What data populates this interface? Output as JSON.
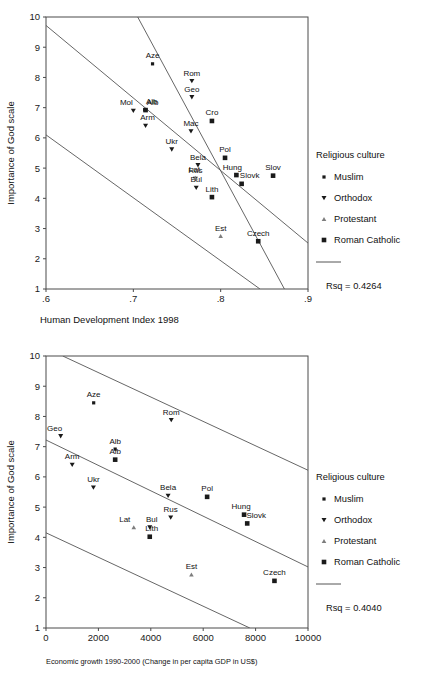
{
  "figure_top": {
    "y_axis_title": "Importance of God scale",
    "x_axis_title": "Human Development Index 1998",
    "x_ticks": [
      ".6",
      ".7",
      ".8",
      ".9"
    ],
    "y_ticks": [
      "1",
      "2",
      "3",
      "4",
      "5",
      "6",
      "7",
      "8",
      "9",
      "10"
    ],
    "rsq": "Rsq = 0.4264",
    "legend_title": "Religious culture",
    "legend": [
      {
        "label": "Muslim",
        "marker": "small-square"
      },
      {
        "label": "Orthodox",
        "marker": "down-triangle"
      },
      {
        "label": "Protestant",
        "marker": "up-triangle"
      },
      {
        "label": "Roman Catholic",
        "marker": "large-square"
      }
    ],
    "chart_data": {
      "type": "scatter",
      "title": "",
      "xlabel": "Human Development Index 1998",
      "ylabel": "Importance of God scale",
      "xlim": [
        0.6,
        0.9
      ],
      "ylim": [
        1,
        10
      ],
      "grid": false,
      "legend_position": "right",
      "annotations": [
        "Rsq = 0.4264"
      ],
      "series": [
        {
          "name": "Muslim",
          "marker": "small-square",
          "points": [
            {
              "label": "Aze",
              "x": 0.722,
              "y": 8.45
            },
            {
              "label": "Alb",
              "x": 0.713,
              "y": 6.93
            }
          ]
        },
        {
          "name": "Orthodox",
          "marker": "down-triangle",
          "points": [
            {
              "label": "Rom",
              "x": 0.767,
              "y": 7.88
            },
            {
              "label": "Geo",
              "x": 0.767,
              "y": 7.35
            },
            {
              "label": "Mol",
              "x": 0.7,
              "y": 6.9
            },
            {
              "label": "Arm",
              "x": 0.714,
              "y": 6.4
            },
            {
              "label": "Mac",
              "x": 0.766,
              "y": 6.22
            },
            {
              "label": "Ukr",
              "x": 0.744,
              "y": 5.62
            },
            {
              "label": "Bela",
              "x": 0.774,
              "y": 5.1
            },
            {
              "label": "Rus",
              "x": 0.771,
              "y": 4.65
            },
            {
              "label": "Bul",
              "x": 0.772,
              "y": 4.35
            }
          ]
        },
        {
          "name": "Protestant",
          "marker": "up-triangle",
          "points": [
            {
              "label": "Lat",
              "x": 0.771,
              "y": 4.68
            },
            {
              "label": "Est",
              "x": 0.8,
              "y": 2.75
            }
          ]
        },
        {
          "name": "Roman Catholic",
          "marker": "large-square",
          "points": [
            {
              "label": "Alb",
              "x": 0.714,
              "y": 6.92
            },
            {
              "label": "Cro",
              "x": 0.79,
              "y": 6.56
            },
            {
              "label": "Pol",
              "x": 0.805,
              "y": 5.34
            },
            {
              "label": "Hung",
              "x": 0.818,
              "y": 4.77
            },
            {
              "label": "Slov",
              "x": 0.86,
              "y": 4.75
            },
            {
              "label": "Slovk",
              "x": 0.824,
              "y": 4.48
            },
            {
              "label": "Lith",
              "x": 0.79,
              "y": 4.04
            },
            {
              "label": "Czech",
              "x": 0.843,
              "y": 2.58
            }
          ]
        }
      ],
      "fit_lines": [
        {
          "name": "upper-ci",
          "points": [
            [
              0.705,
              10.0
            ],
            [
              0.873,
              1.0
            ]
          ]
        },
        {
          "name": "regression",
          "points": [
            [
              0.6,
              9.72
            ],
            [
              0.9,
              2.52
            ]
          ]
        },
        {
          "name": "lower-ci",
          "points": [
            [
              0.6,
              6.1
            ],
            [
              0.845,
              1.0
            ]
          ]
        }
      ]
    }
  },
  "figure_bottom": {
    "y_axis_title": "Importance of God scale",
    "x_axis_title": "Economic growth 1990-2000 (Change in per capita GDP in US$)",
    "x_ticks": [
      "0",
      "2000",
      "4000",
      "6000",
      "8000",
      "10000"
    ],
    "y_ticks": [
      "1",
      "2",
      "3",
      "4",
      "5",
      "6",
      "7",
      "8",
      "9",
      "10"
    ],
    "rsq": "Rsq = 0.4040",
    "legend_title": "Religious culture",
    "legend": [
      {
        "label": "Muslim",
        "marker": "small-square"
      },
      {
        "label": "Orthodox",
        "marker": "down-triangle"
      },
      {
        "label": "Protestant",
        "marker": "up-triangle"
      },
      {
        "label": "Roman Catholic",
        "marker": "large-square"
      }
    ],
    "chart_data": {
      "type": "scatter",
      "title": "",
      "xlabel": "Economic growth 1990-2000 (Change in per capita GDP in US$)",
      "ylabel": "Importance of God scale",
      "xlim": [
        0,
        10000
      ],
      "ylim": [
        1,
        10
      ],
      "grid": false,
      "legend_position": "right",
      "annotations": [
        "Rsq = 0.4040"
      ],
      "series": [
        {
          "name": "Muslim",
          "marker": "small-square",
          "points": [
            {
              "label": "Aze",
              "x": 1820,
              "y": 8.45
            },
            {
              "label": "Alb",
              "x": 2640,
              "y": 6.92
            }
          ]
        },
        {
          "name": "Orthodox",
          "marker": "down-triangle",
          "points": [
            {
              "label": "Rom",
              "x": 4780,
              "y": 7.88
            },
            {
              "label": "Geo",
              "x": 560,
              "y": 7.35
            },
            {
              "label": "Arm",
              "x": 1000,
              "y": 6.4
            },
            {
              "label": "Ukr",
              "x": 1810,
              "y": 5.65
            },
            {
              "label": "Bela",
              "x": 4660,
              "y": 5.38
            },
            {
              "label": "Rus",
              "x": 4760,
              "y": 4.66
            },
            {
              "label": "Bul",
              "x": 3960,
              "y": 4.33
            }
          ]
        },
        {
          "name": "Protestant",
          "marker": "up-triangle",
          "points": [
            {
              "label": "Lat",
              "x": 3350,
              "y": 4.33
            },
            {
              "label": "Est",
              "x": 5550,
              "y": 2.77
            }
          ]
        },
        {
          "name": "Roman Catholic",
          "marker": "large-square",
          "points": [
            {
              "label": "Alb",
              "x": 2640,
              "y": 6.57
            },
            {
              "label": "Pol",
              "x": 6150,
              "y": 5.34
            },
            {
              "label": "Hung",
              "x": 7560,
              "y": 4.75
            },
            {
              "label": "Slovk",
              "x": 7680,
              "y": 4.46
            },
            {
              "label": "Lith",
              "x": 3960,
              "y": 4.02
            },
            {
              "label": "Czech",
              "x": 8720,
              "y": 2.56
            }
          ]
        }
      ],
      "fit_lines": [
        {
          "name": "upper-ci",
          "points": [
            [
              640,
              10.0
            ],
            [
              10000,
              6.22
            ]
          ]
        },
        {
          "name": "regression",
          "points": [
            [
              0,
              7.22
            ],
            [
              10000,
              3.02
            ]
          ]
        },
        {
          "name": "lower-ci",
          "points": [
            [
              0,
              4.15
            ],
            [
              7780,
              1.0
            ]
          ]
        }
      ]
    }
  }
}
